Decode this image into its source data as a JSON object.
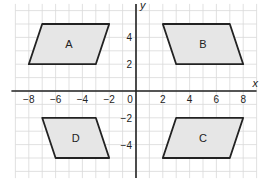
{
  "diagram": {
    "type": "coordinate-grid",
    "grid": {
      "xmin": -9,
      "xmax": 9,
      "ymin": -6.5,
      "ymax": 6.5,
      "step": 1
    },
    "axes": {
      "x_label": "x",
      "y_label": "y",
      "x_ticks": [
        -8,
        -6,
        -4,
        -2,
        0,
        2,
        4,
        6,
        8
      ],
      "y_ticks": [
        4,
        2,
        -2,
        -4
      ]
    },
    "shapes": [
      {
        "label": "A",
        "points": [
          [
            -7,
            5
          ],
          [
            -2,
            5
          ],
          [
            -3,
            2
          ],
          [
            -8,
            2
          ]
        ]
      },
      {
        "label": "B",
        "points": [
          [
            2,
            5
          ],
          [
            7,
            5
          ],
          [
            8,
            2
          ],
          [
            3,
            2
          ]
        ]
      },
      {
        "label": "C",
        "points": [
          [
            3,
            -2
          ],
          [
            8,
            -2
          ],
          [
            7,
            -5
          ],
          [
            2,
            -5
          ]
        ]
      },
      {
        "label": "D",
        "points": [
          [
            -7,
            -2
          ],
          [
            -3,
            -2
          ],
          [
            -2,
            -5
          ],
          [
            -6,
            -5
          ]
        ]
      }
    ],
    "colors": {
      "grid": "#d9d9d9",
      "axis": "#222222",
      "shape_fill": "#e6e6e6",
      "shape_stroke": "#222222"
    }
  }
}
